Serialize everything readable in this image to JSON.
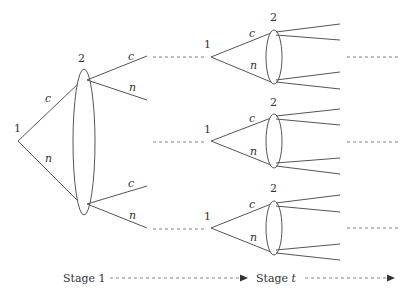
{
  "diagram": {
    "type": "repeated game tree",
    "stage1": {
      "root_label": "1",
      "info_set_label": "2",
      "root_actions": [
        "c",
        "n"
      ],
      "player2_actions_top": [
        "c",
        "n"
      ],
      "player2_actions_bottom": [
        "c",
        "n"
      ]
    },
    "stage_t": {
      "subtrees": [
        {
          "root_label": "1",
          "info_set_label": "2",
          "actions": [
            "c",
            "n"
          ]
        },
        {
          "root_label": "1",
          "info_set_label": "2",
          "actions": [
            "c",
            "n"
          ]
        },
        {
          "root_label": "1",
          "info_set_label": "2",
          "actions": [
            "c",
            "n"
          ]
        }
      ]
    },
    "timeline": {
      "stage1_label": "Stage 1",
      "staget_prefix": "Stage ",
      "staget_var": "t"
    }
  }
}
